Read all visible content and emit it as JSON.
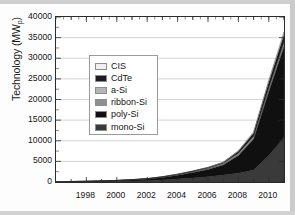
{
  "figure": {
    "title": "",
    "y_axis_label": "Technology (MW",
    "y_axis_label_sub": "p",
    "y_axis_label_tail": ")"
  },
  "legend": {
    "position": "inside-upper-left",
    "items": [
      {
        "label": "CIS",
        "color": "#f0f0f0"
      },
      {
        "label": "CdTe",
        "color": "#1c1c1c"
      },
      {
        "label": "a-Si",
        "color": "#b4b4b4"
      },
      {
        "label": "ribbon-Si",
        "color": "#8f8f8f"
      },
      {
        "label": "poly-Si",
        "color": "#101010"
      },
      {
        "label": "mono-Si",
        "color": "#3a3a3a"
      }
    ]
  },
  "chart_data": {
    "type": "area",
    "stacked": true,
    "title": "",
    "xlabel": "",
    "ylabel": "Technology (MWp)",
    "xlim": [
      1996,
      2011
    ],
    "ylim": [
      0,
      40000
    ],
    "ytick_labels": [
      "40000",
      "35000",
      "30000",
      "25000",
      "20000",
      "15000",
      "10000",
      "5000",
      "0"
    ],
    "ytick_values": [
      40000,
      35000,
      30000,
      25000,
      20000,
      15000,
      10000,
      5000,
      0
    ],
    "xtick_labels": [
      "1998",
      "2000",
      "2002",
      "2004",
      "2006",
      "2008",
      "2010"
    ],
    "xtick_values": [
      1998,
      2000,
      2002,
      2004,
      2006,
      2008,
      2010
    ],
    "minor_xticks": [
      1997,
      1999,
      2001,
      2003,
      2005,
      2007,
      2009,
      2011
    ],
    "grid": "horizontal",
    "legend_position": "upper left inside",
    "x": [
      1996,
      1997,
      1998,
      1999,
      2000,
      2001,
      2002,
      2003,
      2004,
      2005,
      2006,
      2007,
      2008,
      2009,
      2010,
      2011
    ],
    "series": [
      {
        "name": "mono-Si",
        "color": "#3a3a3a",
        "values": [
          40,
          55,
          75,
          110,
          160,
          230,
          320,
          480,
          700,
          950,
          1250,
          1700,
          2150,
          2900,
          6400,
          10800
        ]
      },
      {
        "name": "poly-Si",
        "color": "#101010",
        "values": [
          35,
          50,
          70,
          110,
          170,
          260,
          380,
          620,
          950,
          1350,
          1800,
          2400,
          4300,
          7500,
          15500,
          22000
        ]
      },
      {
        "name": "ribbon-Si",
        "color": "#8f8f8f",
        "values": [
          5,
          7,
          10,
          15,
          22,
          32,
          45,
          65,
          90,
          120,
          150,
          180,
          210,
          230,
          260,
          280
        ]
      },
      {
        "name": "a-Si",
        "color": "#b4b4b4",
        "values": [
          8,
          10,
          14,
          20,
          28,
          40,
          55,
          75,
          100,
          135,
          180,
          240,
          330,
          430,
          620,
          800
        ]
      },
      {
        "name": "CdTe",
        "color": "#1c1c1c",
        "values": [
          2,
          3,
          4,
          6,
          9,
          14,
          20,
          32,
          55,
          90,
          140,
          220,
          480,
          820,
          1450,
          1900
        ]
      },
      {
        "name": "CIS",
        "color": "#f0f0f0",
        "values": [
          1,
          1,
          2,
          3,
          4,
          6,
          9,
          14,
          22,
          35,
          55,
          85,
          150,
          260,
          480,
          620
        ]
      }
    ],
    "totals": [
      91,
      126,
      175,
      264,
      393,
      582,
      829,
      1286,
      1917,
      2680,
      3575,
      4825,
      7620,
      12140,
      24710,
      36400
    ],
    "annotations": []
  }
}
